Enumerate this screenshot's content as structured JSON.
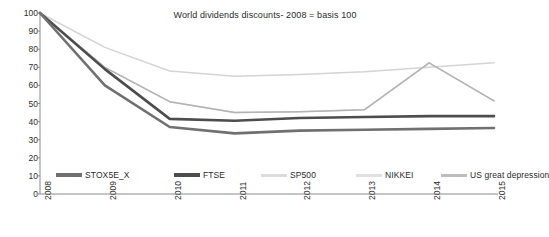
{
  "chart_data": {
    "type": "line",
    "title": "World dividends discounts- 2008 = basis 100",
    "xlabel": "",
    "ylabel": "",
    "x": [
      "2008",
      "2009",
      "2010",
      "2011",
      "2012",
      "2013",
      "2014",
      "2015"
    ],
    "categories": [
      "2008",
      "2009",
      "2010",
      "2011",
      "2012",
      "2013",
      "2014",
      "2015"
    ],
    "ylim": [
      0,
      100
    ],
    "yticks": [
      0,
      10,
      20,
      30,
      40,
      50,
      60,
      70,
      80,
      90,
      100
    ],
    "grid": false,
    "legend_position": "bottom",
    "series": [
      {
        "name": "STOX5E_X",
        "color": "#707070",
        "values": [
          100,
          60,
          37,
          33.5,
          35,
          35.5,
          36,
          36.5
        ]
      },
      {
        "name": "FTSE",
        "color": "#4d4d4d",
        "values": [
          100,
          69,
          41.5,
          40.5,
          42,
          42.5,
          43,
          43
        ]
      },
      {
        "name": "SP500",
        "color": "#d4d4d4",
        "values": [
          100,
          81,
          68,
          65,
          66,
          67.5,
          70,
          72.5
        ]
      },
      {
        "name": "NIKKEI",
        "color": "#d9d9d9",
        "values": [
          100,
          70,
          51,
          45,
          45.5,
          46.5,
          72.5,
          51.5
        ]
      },
      {
        "name": "US great depression",
        "color": "#b3b3b3",
        "values": [
          100,
          70,
          51,
          45,
          45.5,
          46.5,
          72.5,
          51.5
        ]
      }
    ]
  },
  "axis": {
    "y_labels": [
      "100",
      "90",
      "80",
      "70",
      "60",
      "50",
      "40",
      "30",
      "20",
      "10",
      "0"
    ],
    "x_labels": [
      "2008",
      "2009",
      "2010",
      "2011",
      "2012",
      "2013",
      "2014",
      "2015"
    ],
    "axis_color": "#8a8a8a"
  },
  "legend": {
    "items": [
      {
        "label": "STOX5E_X",
        "color": "#707070",
        "thick": true
      },
      {
        "label": "FTSE",
        "color": "#4d4d4d",
        "thick": true
      },
      {
        "label": "SP500",
        "color": "#dcdcdc",
        "thick": false
      },
      {
        "label": "NIKKEI",
        "color": "#e0e0e0",
        "thick": false
      },
      {
        "label": "US great depression",
        "color": "#bdbdbd",
        "thick": false
      }
    ]
  },
  "colors": {
    "background": "#ffffff",
    "text": "#2a2a2a",
    "axis": "#8a8a8a"
  }
}
